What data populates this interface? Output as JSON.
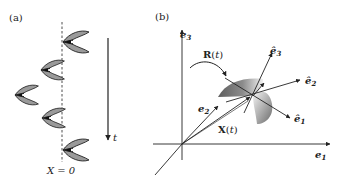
{
  "panel_a": {
    "label": "(a)",
    "axis_label": "X = 0",
    "time_label": "t",
    "swimmers": [
      {
        "x": 66,
        "y": 42,
        "scale": 1.0
      },
      {
        "x": 44,
        "y": 71,
        "scale": 0.85
      },
      {
        "x": 17,
        "y": 95,
        "scale": 0.85
      },
      {
        "x": 44,
        "y": 118,
        "scale": 0.85
      },
      {
        "x": 66,
        "y": 148,
        "scale": 1.0
      }
    ]
  },
  "panel_b": {
    "label": "(b)",
    "lab_axes": {
      "e1": "e1",
      "e2": "e2",
      "e3": "e3"
    },
    "body_axes": {
      "e1": "ê1",
      "e2": "ê2",
      "e3": "ê3"
    },
    "rotation_label": "R(t)",
    "position_label": "X(t)"
  },
  "colors": {
    "ink": "#222222",
    "body_fill_dark": "#6f6f6f",
    "body_fill_mid": "#9a9a9a",
    "body_fill_light": "#e8e8e8"
  }
}
